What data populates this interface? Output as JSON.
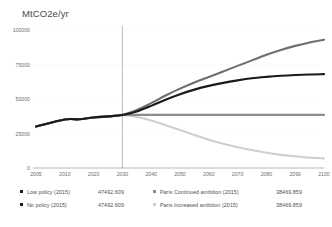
{
  "chart_data": {
    "type": "line",
    "title": "",
    "ylabel": "MtCO2e/yr",
    "xlabel": "",
    "xlim": [
      2005,
      2100
    ],
    "ylim": [
      0,
      100000
    ],
    "grid": true,
    "legend_position": "bottom",
    "yticks": [
      "100000",
      "75000",
      "50000",
      "25000",
      "0"
    ],
    "ytick_values": [
      100000,
      75000,
      50000,
      25000,
      0
    ],
    "xticks": [
      "2005",
      "2010",
      "2020",
      "2030",
      "2040",
      "2050",
      "2060",
      "2070",
      "2080",
      "2090",
      "2100"
    ],
    "xtick_values": [
      2005,
      2010,
      2020,
      2030,
      2040,
      2050,
      2060,
      2070,
      2080,
      2090,
      2100
    ],
    "reference_line_x": 2030,
    "x": [
      2005,
      2010,
      2015,
      2020,
      2025,
      2030,
      2035,
      2040,
      2045,
      2050,
      2055,
      2060,
      2065,
      2070,
      2075,
      2080,
      2085,
      2090,
      2095,
      2100
    ],
    "series": [
      {
        "name": "No policy (2015)",
        "color": "#6e6e6e",
        "values": [
          30000,
          35200,
          35300,
          36600,
          37400,
          38470,
          42000,
          47000,
          52500,
          57500,
          62000,
          66000,
          70000,
          74000,
          78000,
          82000,
          85500,
          88500,
          91000,
          93000
        ]
      },
      {
        "name": "Low policy (2015)",
        "color": "#1a1a1a",
        "values": [
          30000,
          35200,
          35300,
          36600,
          37400,
          38470,
          41000,
          45000,
          49500,
          53500,
          56800,
          59500,
          61700,
          63500,
          65000,
          66000,
          66800,
          67400,
          67800,
          68000
        ]
      },
      {
        "name": "Paris Continued ambition (2015)",
        "color": "#8c8c8c",
        "values": [
          30000,
          35200,
          35300,
          36600,
          37400,
          38470,
          38470,
          38470,
          38470,
          38470,
          38470,
          38470,
          38470,
          38470,
          38470,
          38470,
          38470,
          38470,
          38470,
          38470
        ]
      },
      {
        "name": "Paris Increased ambition (2015)",
        "color": "#cfcfcf",
        "values": [
          30000,
          35200,
          35300,
          36600,
          37400,
          38470,
          37000,
          34500,
          31000,
          27500,
          24000,
          20500,
          17500,
          15000,
          13000,
          11000,
          9500,
          8500,
          7600,
          7000
        ]
      }
    ]
  },
  "legend": {
    "rows": [
      {
        "label": "Low policy (2015)",
        "value": "47492.609",
        "marker_color": "#1a1a1a"
      },
      {
        "label": "No policy (2015)",
        "value": "47492.609",
        "marker_color": "#1a1a1a"
      },
      {
        "label": "Paris Continued ambition (2015)",
        "value": "38469.859",
        "marker_color": "#8c8c8c"
      },
      {
        "label": "Paris Increased ambition (2015)",
        "value": "38469.859",
        "marker_color": "#cfcfcf"
      }
    ]
  }
}
